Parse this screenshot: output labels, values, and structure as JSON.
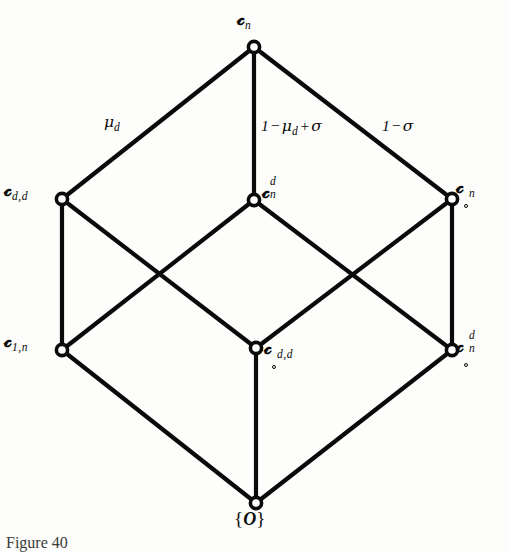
{
  "figure": {
    "caption": "Figure 40",
    "background_color": "#fdfdfb",
    "line_color": "#0a0a0a",
    "node_fill": "#ffffff"
  },
  "diagram": {
    "type": "lattice-hasse-cube",
    "nodes": [
      {
        "id": "top",
        "label_text": "A_n",
        "x": 254,
        "y": 47,
        "label_x": 243,
        "label_y": 12
      },
      {
        "id": "upper-left",
        "label_text": "A_d,d",
        "x": 62,
        "y": 199,
        "label_x": 4,
        "label_y": 181
      },
      {
        "id": "upper-center",
        "label_text": "A_n^d",
        "x": 254,
        "y": 200,
        "label_x": 263,
        "label_y": 176
      },
      {
        "id": "upper-right",
        "label_text": "oA_n",
        "x": 452,
        "y": 199,
        "label_x": 457,
        "label_y": 178
      },
      {
        "id": "lower-left",
        "label_text": "A_1,n",
        "x": 62,
        "y": 350,
        "label_x": 4,
        "label_y": 332
      },
      {
        "id": "lower-center",
        "label_text": "oA_d,d",
        "x": 256,
        "y": 348,
        "label_x": 265,
        "label_y": 339
      },
      {
        "id": "lower-right",
        "label_text": "oA_n^d",
        "x": 452,
        "y": 350,
        "label_x": 457,
        "label_y": 330
      },
      {
        "id": "bottom",
        "label_text": "{O}",
        "x": 256,
        "y": 503,
        "label_x": 235,
        "label_y": 511
      }
    ],
    "edges": [
      {
        "from": "top",
        "to": "upper-left",
        "label": "mu_d"
      },
      {
        "from": "top",
        "to": "upper-center",
        "label": "1-mu_d+sigma"
      },
      {
        "from": "top",
        "to": "upper-right",
        "label": "1-sigma"
      },
      {
        "from": "upper-left",
        "to": "lower-left",
        "label": null
      },
      {
        "from": "upper-left",
        "to": "lower-center",
        "label": null
      },
      {
        "from": "upper-center",
        "to": "lower-left",
        "label": null
      },
      {
        "from": "upper-center",
        "to": "lower-right",
        "label": null
      },
      {
        "from": "upper-right",
        "to": "lower-center",
        "label": null
      },
      {
        "from": "upper-right",
        "to": "lower-right",
        "label": null
      },
      {
        "from": "lower-left",
        "to": "bottom",
        "label": null
      },
      {
        "from": "lower-center",
        "to": "bottom",
        "label": null
      },
      {
        "from": "lower-right",
        "to": "bottom",
        "label": null
      }
    ],
    "edge_labels": {
      "left": {
        "text": "mu_d",
        "x": 106,
        "y": 116
      },
      "center": {
        "text": "1-mu_d+sigma",
        "x": 262,
        "y": 120
      },
      "right": {
        "text": "1-sigma",
        "x": 383,
        "y": 120
      }
    },
    "node_label_parts": {
      "top": {
        "base": "A",
        "sub": "n",
        "sup": "",
        "ring": false
      },
      "upper_left": {
        "base": "A",
        "sub": "d,d",
        "sup": "",
        "ring": false
      },
      "upper_center": {
        "base": "A",
        "sub": "n",
        "sup": "d",
        "ring": false
      },
      "upper_right": {
        "base": "A",
        "sub": "n",
        "sup": "",
        "ring": true
      },
      "lower_left": {
        "base": "A",
        "sub": "1,n",
        "sup": "",
        "ring": false
      },
      "lower_center": {
        "base": "A",
        "sub": "d,d",
        "sup": "",
        "ring": true
      },
      "lower_right": {
        "base": "A",
        "sub": "n",
        "sup": "d",
        "ring": true
      },
      "bottom": {
        "base": "O",
        "sub": "",
        "sup": "",
        "ring": false
      }
    },
    "symbols": {
      "fraktur_a": "ℬ",
      "mu": "μ",
      "sigma": "σ",
      "minus": "−",
      "plus": "+",
      "one": "1",
      "brace_open": "{",
      "brace_close": "}",
      "zero": "O"
    }
  }
}
